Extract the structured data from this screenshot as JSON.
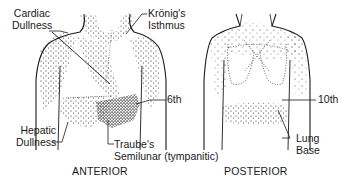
{
  "figure": {
    "anterior": {
      "caption": "ANTERIOR",
      "labels": {
        "cardiac_line1": "Cardiac",
        "cardiac_line2": "Dullness",
        "kronig_line1": "Krönig's",
        "kronig_line2": "Isthmus",
        "sixth": "6th",
        "hepatic_line1": "Hepatic",
        "hepatic_line2": "Dullness",
        "traube_line1": "Traube's",
        "traube_line2": "Semilunar (tympanitic)"
      }
    },
    "posterior": {
      "caption": "POSTERIOR",
      "labels": {
        "tenth": "10th",
        "lung_line1": "Lung",
        "lung_line2": "Base"
      }
    },
    "colors": {
      "ink": "#1a1a1a",
      "background": "#ffffff"
    }
  }
}
